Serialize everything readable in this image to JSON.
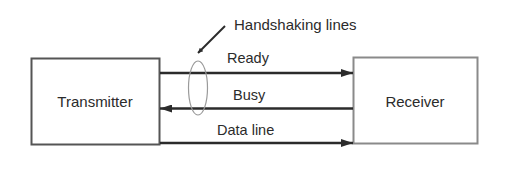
{
  "diagram": {
    "title": "Handshaking lines",
    "colors": {
      "background": "#ffffff",
      "line": "#2b2b2b",
      "box_border": "#555555",
      "ellipse": "#8a8a8a",
      "text": "#2b2b2b"
    },
    "nodes": {
      "transmitter": {
        "label": "Transmitter"
      },
      "receiver": {
        "label": "Receiver"
      }
    },
    "lines": [
      {
        "label": "Ready",
        "direction": "transmitter-to-receiver"
      },
      {
        "label": "Busy",
        "direction": "receiver-to-transmitter"
      },
      {
        "label": "Data line",
        "direction": "transmitter-to-receiver"
      }
    ],
    "annotation": {
      "label": "Handshaking lines",
      "target": "Ready and Busy lines (grouped by ellipse)"
    }
  }
}
